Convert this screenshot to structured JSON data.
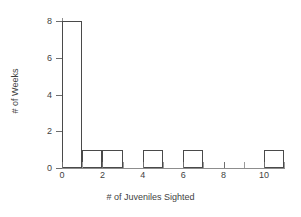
{
  "chart_data": {
    "type": "bar",
    "title": "",
    "subtitle": "",
    "xlabel": "# of Juveniles Sighted",
    "ylabel": "# of Weeks",
    "grid": false,
    "legend": false,
    "legend_position": "none",
    "bin_width": 1,
    "xlim": [
      0,
      11.5
    ],
    "ylim": [
      0,
      8.6
    ],
    "x_ticks": [
      0,
      1,
      2,
      3,
      4,
      5,
      6,
      7,
      8,
      9,
      10,
      11
    ],
    "x_tick_labels": [
      "0",
      "",
      "2",
      "",
      "4",
      "",
      "6",
      "",
      "8",
      "",
      "10",
      ""
    ],
    "y_ticks": [
      0,
      2,
      4,
      6,
      8
    ],
    "y_tick_labels": [
      "0",
      "2",
      "4",
      "6",
      "8"
    ],
    "bin_edges": [
      0,
      1,
      2,
      3,
      4,
      5,
      6,
      7,
      8,
      9,
      10,
      11
    ],
    "categories": [
      "0-1",
      "1-2",
      "2-3",
      "3-4",
      "4-5",
      "5-6",
      "6-7",
      "7-8",
      "8-9",
      "9-10",
      "10-11"
    ],
    "values": [
      8,
      1,
      1,
      0,
      1,
      0,
      1,
      0,
      0,
      0,
      1
    ],
    "bars": [
      {
        "left": 0,
        "right": 1,
        "value": 8
      },
      {
        "left": 1,
        "right": 2,
        "value": 1
      },
      {
        "left": 2,
        "right": 3,
        "value": 1
      },
      {
        "left": 3,
        "right": 4,
        "value": 0
      },
      {
        "left": 4,
        "right": 5,
        "value": 1
      },
      {
        "left": 5,
        "right": 6,
        "value": 0
      },
      {
        "left": 6,
        "right": 7,
        "value": 1
      },
      {
        "left": 7,
        "right": 8,
        "value": 0
      },
      {
        "left": 8,
        "right": 9,
        "value": 0
      },
      {
        "left": 9,
        "right": 10,
        "value": 0
      },
      {
        "left": 10,
        "right": 11,
        "value": 1
      }
    ],
    "colors": {
      "bar_fill": "#ffffff",
      "bar_stroke": "#4a4a4a",
      "axis": "#8d8d8d",
      "text": "#3f3f3f",
      "background": "#ffffff"
    }
  }
}
